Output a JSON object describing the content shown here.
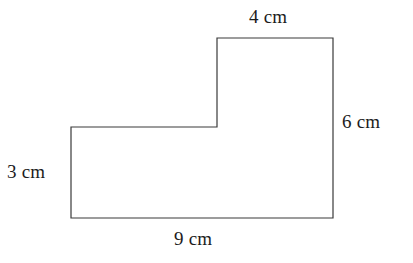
{
  "figure": {
    "name": "l-shaped-polygon",
    "stroke_color": "#3a3a3a",
    "fill_color": "#ffffff",
    "background_color": "#ffffff",
    "stroke_width": 1.2,
    "vertices": [
      [
        71,
        127
      ],
      [
        217,
        127
      ],
      [
        217,
        38
      ],
      [
        333,
        38
      ],
      [
        333,
        218
      ],
      [
        71,
        218
      ]
    ]
  },
  "labels": {
    "top": "4 cm",
    "right": "6 cm",
    "left": "3 cm",
    "bottom": "9 cm"
  },
  "chart_data": {
    "type": "diagram",
    "title": "",
    "shape": "L-shaped polygon",
    "units": "cm",
    "labeled_sides": [
      {
        "position": "top",
        "label": "4 cm",
        "value": 4,
        "edge": "top edge of tall right section"
      },
      {
        "position": "right",
        "label": "6 cm",
        "value": 6,
        "edge": "right vertical edge"
      },
      {
        "position": "left",
        "label": "3 cm",
        "value": 3,
        "edge": "left vertical edge"
      },
      {
        "position": "bottom",
        "label": "9 cm",
        "value": 9,
        "edge": "bottom horizontal edge"
      }
    ]
  }
}
